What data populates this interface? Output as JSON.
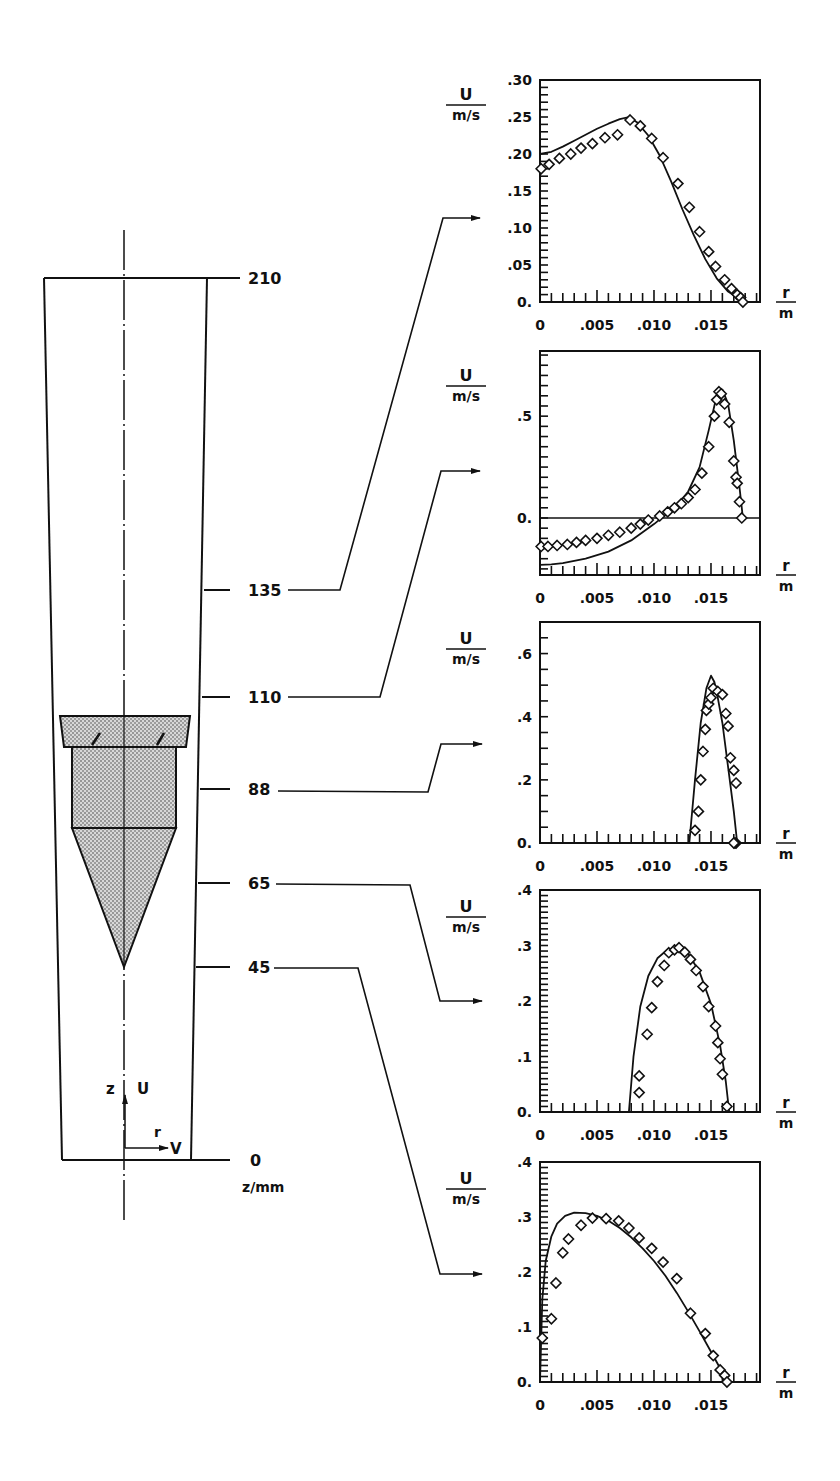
{
  "figure": {
    "axis_label_units": {
      "numerator": "U",
      "denominator": "m/s"
    },
    "x_label": {
      "numerator": "r",
      "denominator": "m"
    },
    "x_ticks": [
      "0",
      ".005",
      ".010",
      ".015"
    ],
    "diagram": {
      "station_labels": [
        "210",
        "135",
        "110",
        "88",
        "65",
        "45",
        "0"
      ],
      "z_axis_label": "z/mm",
      "coord_labels": {
        "z": "z",
        "U": "U",
        "r": "r",
        "V": "V"
      }
    }
  },
  "chart_data": [
    {
      "type": "line",
      "title": "z = 135 mm",
      "xlabel": "r / m",
      "ylabel": "U / m/s",
      "xlim": [
        0,
        0.0193
      ],
      "ylim": [
        0,
        0.3
      ],
      "y_ticks": [
        ".30",
        ".25",
        ".20",
        ".15",
        ".10",
        ".05",
        "0."
      ],
      "y_tick_values": [
        0.3,
        0.25,
        0.2,
        0.15,
        0.1,
        0.05,
        0.0
      ],
      "grid": false,
      "series": [
        {
          "name": "computed",
          "style": "line",
          "x": [
            0,
            0.001,
            0.002,
            0.003,
            0.004,
            0.005,
            0.006,
            0.007,
            0.0078,
            0.0085,
            0.0095,
            0.0105,
            0.0115,
            0.0125,
            0.0135,
            0.0145,
            0.0155,
            0.0165,
            0.0175,
            0.018
          ],
          "y": [
            0.2,
            0.203,
            0.21,
            0.218,
            0.226,
            0.234,
            0.241,
            0.247,
            0.25,
            0.243,
            0.225,
            0.198,
            0.163,
            0.125,
            0.09,
            0.058,
            0.032,
            0.014,
            0.004,
            0.0
          ]
        },
        {
          "name": "measured",
          "style": "diamond",
          "x": [
            0.0001,
            0.0008,
            0.0017,
            0.0027,
            0.0036,
            0.0046,
            0.0057,
            0.0068,
            0.0079,
            0.0088,
            0.0098,
            0.0108,
            0.0121,
            0.0131,
            0.014,
            0.0148,
            0.0154,
            0.0162,
            0.0168,
            0.0173,
            0.0176,
            0.0178
          ],
          "y": [
            0.18,
            0.186,
            0.194,
            0.2,
            0.208,
            0.214,
            0.222,
            0.226,
            0.246,
            0.238,
            0.221,
            0.195,
            0.16,
            0.128,
            0.095,
            0.068,
            0.048,
            0.03,
            0.018,
            0.01,
            0.006,
            0.0
          ]
        }
      ]
    },
    {
      "type": "line",
      "title": "z = 110 mm",
      "xlabel": "r / m",
      "ylabel": "U / m/s",
      "xlim": [
        0,
        0.0193
      ],
      "ylim": [
        -0.28,
        0.82
      ],
      "y_ticks": [
        ".5",
        "0."
      ],
      "y_tick_values": [
        0.5,
        0.0
      ],
      "zero_line": true,
      "grid": false,
      "series": [
        {
          "name": "computed",
          "style": "line",
          "x": [
            0,
            0.001,
            0.002,
            0.004,
            0.006,
            0.008,
            0.01,
            0.012,
            0.013,
            0.014,
            0.0148,
            0.0155,
            0.016,
            0.0165,
            0.017,
            0.0175,
            0.0178
          ],
          "y": [
            -0.23,
            -0.228,
            -0.222,
            -0.2,
            -0.165,
            -0.11,
            -0.03,
            0.06,
            0.13,
            0.25,
            0.43,
            0.6,
            0.63,
            0.56,
            0.38,
            0.15,
            0.0
          ]
        },
        {
          "name": "measured",
          "style": "diamond",
          "x": [
            0.0001,
            0.0007,
            0.0015,
            0.0024,
            0.0032,
            0.004,
            0.005,
            0.006,
            0.007,
            0.008,
            0.0088,
            0.0095,
            0.0105,
            0.0112,
            0.0118,
            0.0124,
            0.013,
            0.0136,
            0.0142,
            0.0148,
            0.0153,
            0.0155,
            0.0157,
            0.0159,
            0.0162,
            0.0166,
            0.017,
            0.0172,
            0.0173,
            0.0175,
            0.0177
          ],
          "y": [
            -0.14,
            -0.14,
            -0.135,
            -0.13,
            -0.12,
            -0.11,
            -0.1,
            -0.085,
            -0.07,
            -0.05,
            -0.03,
            -0.01,
            0.01,
            0.03,
            0.05,
            0.07,
            0.1,
            0.14,
            0.22,
            0.35,
            0.5,
            0.58,
            0.62,
            0.61,
            0.56,
            0.47,
            0.28,
            0.2,
            0.17,
            0.08,
            0.0
          ]
        }
      ]
    },
    {
      "type": "line",
      "title": "z = 88 mm",
      "xlabel": "r / m",
      "ylabel": "U / m/s",
      "xlim": [
        0,
        0.0193
      ],
      "ylim": [
        0,
        0.7
      ],
      "y_ticks": [
        ".6",
        ".4",
        ".2",
        "0."
      ],
      "y_tick_values": [
        0.6,
        0.4,
        0.2,
        0.0
      ],
      "grid": false,
      "series": [
        {
          "name": "computed",
          "style": "line",
          "x": [
            0.0131,
            0.0136,
            0.0141,
            0.0146,
            0.015,
            0.0153,
            0.0156,
            0.016,
            0.0165,
            0.017,
            0.0173
          ],
          "y": [
            0.0,
            0.2,
            0.38,
            0.49,
            0.53,
            0.51,
            0.46,
            0.38,
            0.24,
            0.1,
            0.0
          ]
        },
        {
          "name": "measured",
          "style": "diamond",
          "x": [
            0.0136,
            0.0139,
            0.0141,
            0.0143,
            0.0145,
            0.0146,
            0.0148,
            0.015,
            0.0152,
            0.0156,
            0.016,
            0.0163,
            0.0165,
            0.0167,
            0.017,
            0.0172,
            0.0172,
            0.0171,
            0.017
          ],
          "y": [
            0.04,
            0.1,
            0.2,
            0.29,
            0.36,
            0.42,
            0.44,
            0.46,
            0.49,
            0.48,
            0.47,
            0.41,
            0.37,
            0.27,
            0.23,
            0.19,
            0.0,
            0.0,
            0.0
          ]
        }
      ]
    },
    {
      "type": "line",
      "title": "z = 65 mm",
      "xlabel": "r / m",
      "ylabel": "U / m/s",
      "xlim": [
        0,
        0.0193
      ],
      "ylim": [
        0,
        0.4
      ],
      "y_ticks": [
        ".4",
        ".3",
        ".2",
        ".1",
        "0."
      ],
      "y_tick_values": [
        0.4,
        0.3,
        0.2,
        0.1,
        0.0
      ],
      "grid": false,
      "series": [
        {
          "name": "computed",
          "style": "line",
          "x": [
            0.0078,
            0.0082,
            0.0088,
            0.0095,
            0.0103,
            0.0112,
            0.0122,
            0.013,
            0.014,
            0.015,
            0.0158,
            0.0163,
            0.0166
          ],
          "y": [
            0.0,
            0.1,
            0.19,
            0.245,
            0.277,
            0.293,
            0.296,
            0.285,
            0.252,
            0.195,
            0.12,
            0.055,
            0.0
          ]
        },
        {
          "name": "measured",
          "style": "diamond",
          "x": [
            0.0087,
            0.0087,
            0.0094,
            0.0098,
            0.0103,
            0.0109,
            0.0113,
            0.0118,
            0.0122,
            0.0127,
            0.0132,
            0.0137,
            0.0143,
            0.0148,
            0.0154,
            0.0156,
            0.0158,
            0.016,
            0.0164
          ],
          "y": [
            0.035,
            0.065,
            0.14,
            0.188,
            0.235,
            0.264,
            0.287,
            0.292,
            0.296,
            0.288,
            0.275,
            0.255,
            0.226,
            0.19,
            0.155,
            0.125,
            0.096,
            0.068,
            0.01
          ]
        }
      ]
    },
    {
      "type": "line",
      "title": "z = 45 mm",
      "xlabel": "r / m",
      "ylabel": "U / m/s",
      "xlim": [
        0,
        0.0193
      ],
      "ylim": [
        0,
        0.4
      ],
      "y_ticks": [
        ".4",
        ".3",
        ".2",
        ".1",
        "0."
      ],
      "y_tick_values": [
        0.4,
        0.3,
        0.2,
        0.1,
        0.0
      ],
      "grid": false,
      "series": [
        {
          "name": "computed",
          "style": "line",
          "x": [
            0,
            0.0002,
            0.0005,
            0.001,
            0.0015,
            0.0022,
            0.003,
            0.004,
            0.005,
            0.006,
            0.007,
            0.008,
            0.009,
            0.01,
            0.011,
            0.012,
            0.013,
            0.014,
            0.015,
            0.0158,
            0.0165
          ],
          "y": [
            0.0,
            0.15,
            0.22,
            0.265,
            0.288,
            0.302,
            0.308,
            0.307,
            0.302,
            0.293,
            0.28,
            0.263,
            0.243,
            0.22,
            0.193,
            0.162,
            0.128,
            0.092,
            0.055,
            0.025,
            0.0
          ]
        },
        {
          "name": "measured",
          "style": "diamond",
          "x": [
            0.0002,
            0.001,
            0.0014,
            0.002,
            0.0025,
            0.0036,
            0.0046,
            0.0058,
            0.0069,
            0.0078,
            0.0087,
            0.0098,
            0.0108,
            0.012,
            0.0132,
            0.0145,
            0.0152,
            0.0158,
            0.0162,
            0.0164
          ],
          "y": [
            0.08,
            0.115,
            0.18,
            0.235,
            0.26,
            0.285,
            0.298,
            0.297,
            0.293,
            0.28,
            0.262,
            0.243,
            0.218,
            0.188,
            0.125,
            0.088,
            0.048,
            0.022,
            0.012,
            0.0
          ]
        }
      ]
    }
  ]
}
